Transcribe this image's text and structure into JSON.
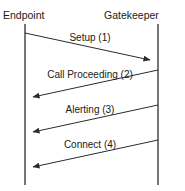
{
  "diagram": {
    "type": "sequence-diagram",
    "title": "",
    "background_color": "#ffffff",
    "line_color": "#2b2b2b",
    "lifeline_color": "#3b3b3b",
    "text_color": "#1a1a1a",
    "actors": [
      {
        "id": "endpoint",
        "label": "Endpoint",
        "x": 25
      },
      {
        "id": "gatekeeper",
        "label": "Gatekeeper",
        "x": 158
      }
    ],
    "messages": [
      {
        "label": "Setup (1)",
        "from": "endpoint",
        "to": "gatekeeper",
        "direction": "right",
        "y_start": 33,
        "y_end": 60,
        "label_x": 90,
        "label_y": 41
      },
      {
        "label": "Call Proceeding (2)",
        "from": "gatekeeper",
        "to": "endpoint",
        "direction": "left",
        "y_start": 70,
        "y_end": 97,
        "label_x": 90,
        "label_y": 78
      },
      {
        "label": "Alerting (3)",
        "from": "gatekeeper",
        "to": "endpoint",
        "direction": "left",
        "y_start": 105,
        "y_end": 132,
        "label_x": 90,
        "label_y": 113
      },
      {
        "label": "Connect (4)",
        "from": "gatekeeper",
        "to": "endpoint",
        "direction": "left",
        "y_start": 140,
        "y_end": 167,
        "label_x": 90,
        "label_y": 148
      }
    ]
  }
}
